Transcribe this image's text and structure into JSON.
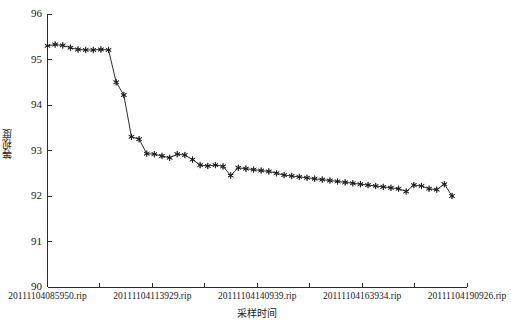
{
  "chart_data": {
    "type": "line",
    "title": "",
    "xlabel": "采样时间",
    "ylabel": "等视度",
    "ylim": [
      90,
      96
    ],
    "yticks": [
      90,
      91,
      92,
      93,
      94,
      95,
      96
    ],
    "ytick_labels": [
      "90",
      "91",
      "92",
      "93",
      "94",
      "95",
      "96"
    ],
    "grid": false,
    "legend": null,
    "marker": "star",
    "line_color": "#2f2f2f",
    "xtick_labels": [
      "20111104085950.rip",
      "20111104113929.rip",
      "20111104140939.rip",
      "20111104163934.rip",
      "20111104190926.rip"
    ],
    "xtick_positions": [
      0,
      12,
      24,
      36,
      48
    ],
    "x_minor_tick_count": 9,
    "x": [
      0,
      1,
      2,
      3,
      4,
      5,
      6,
      7,
      8,
      9,
      10,
      11,
      12,
      13,
      14,
      15,
      16,
      17,
      18,
      19,
      20,
      21,
      22,
      23,
      24,
      25,
      26,
      27,
      28,
      29,
      30,
      31,
      32,
      33,
      34,
      35,
      36,
      37,
      38,
      39,
      40,
      41,
      42,
      43,
      44,
      45,
      46,
      47,
      48,
      49,
      50,
      51,
      52,
      53
    ],
    "values": [
      95.3,
      95.33,
      95.31,
      95.26,
      95.22,
      95.21,
      95.21,
      95.22,
      95.21,
      94.5,
      94.22,
      93.3,
      93.25,
      92.93,
      92.92,
      92.88,
      92.84,
      92.92,
      92.9,
      92.8,
      92.68,
      92.66,
      92.68,
      92.65,
      92.45,
      92.62,
      92.6,
      92.58,
      92.56,
      92.54,
      92.5,
      92.46,
      92.44,
      92.42,
      92.4,
      92.38,
      92.36,
      92.34,
      92.32,
      92.3,
      92.28,
      92.26,
      92.24,
      92.22,
      92.2,
      92.18,
      92.16,
      92.1,
      92.24,
      92.22,
      92.16,
      92.14,
      92.26,
      92.0
    ]
  }
}
